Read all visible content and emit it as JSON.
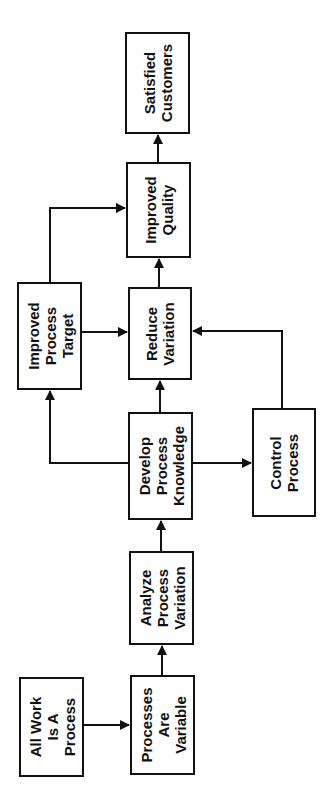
{
  "diagram": {
    "orientation": "rotated-90-ccw",
    "nodes": [
      {
        "id": "all_work",
        "label": "All Work\nIs A\nProcess"
      },
      {
        "id": "processes_variable",
        "label": "Processes\nAre\nVariable"
      },
      {
        "id": "analyze_variation",
        "label": "Analyze\nProcess\nVariation"
      },
      {
        "id": "develop_knowledge",
        "label": "Develop\nProcess\nKnowledge"
      },
      {
        "id": "control_process",
        "label": "Control\nProcess"
      },
      {
        "id": "improved_target",
        "label": "Improved\nProcess\nTarget"
      },
      {
        "id": "reduce_variation",
        "label": "Reduce\nVariation"
      },
      {
        "id": "improved_quality",
        "label": "Improved\nQuality"
      },
      {
        "id": "satisfied_customers",
        "label": "Satisfied\nCustomers"
      }
    ],
    "edges": [
      {
        "from": "all_work",
        "to": "processes_variable"
      },
      {
        "from": "processes_variable",
        "to": "analyze_variation"
      },
      {
        "from": "analyze_variation",
        "to": "develop_knowledge"
      },
      {
        "from": "develop_knowledge",
        "to": "improved_target"
      },
      {
        "from": "develop_knowledge",
        "to": "reduce_variation"
      },
      {
        "from": "develop_knowledge",
        "to": "control_process"
      },
      {
        "from": "control_process",
        "to": "reduce_variation"
      },
      {
        "from": "improved_target",
        "to": "reduce_variation"
      },
      {
        "from": "improved_target",
        "to": "improved_quality"
      },
      {
        "from": "reduce_variation",
        "to": "improved_quality"
      },
      {
        "from": "improved_quality",
        "to": "satisfied_customers"
      }
    ],
    "colors": {
      "line": "#111111",
      "background": "#ffffff"
    }
  }
}
